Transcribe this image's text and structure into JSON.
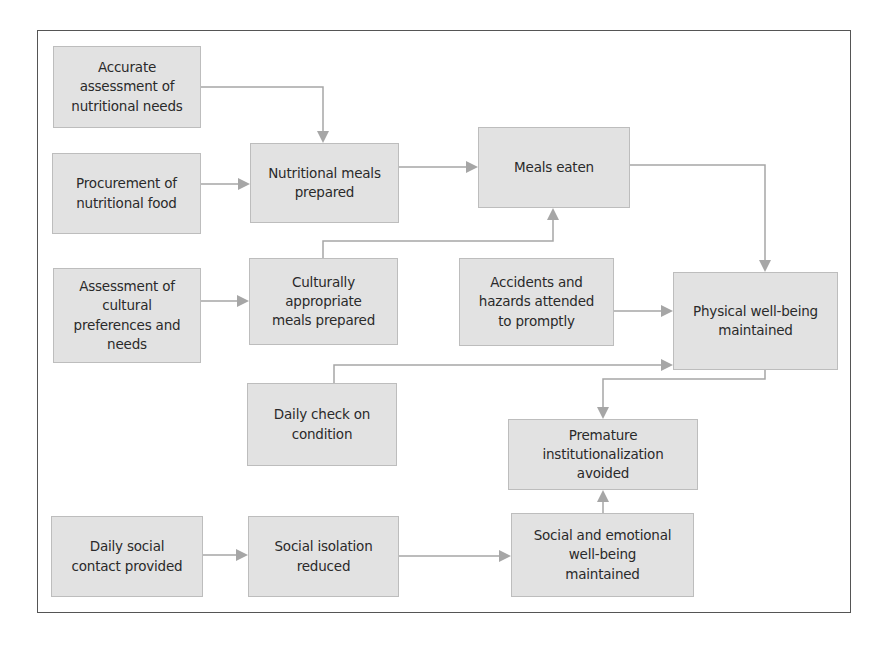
{
  "diagram": {
    "type": "flowchart",
    "colors": {
      "node_fill": "#e2e2e2",
      "node_border": "#bdbdbd",
      "connector": "#a6a6a6",
      "frame": "#555555",
      "text": "#2a2a2a"
    },
    "nodes": {
      "accurate_assessment": {
        "label": "Accurate\nassessment of\nnutritional needs"
      },
      "procurement": {
        "label": "Procurement of\nnutritional food"
      },
      "nutritional_meals": {
        "label": "Nutritional meals\nprepared"
      },
      "meals_eaten": {
        "label": "Meals eaten"
      },
      "assessment_cultural": {
        "label": "Assessment of\ncultural\npreferences and\nneeds"
      },
      "culturally_appropriate": {
        "label": "Culturally\nappropriate\nmeals prepared"
      },
      "accidents_hazards": {
        "label": "Accidents and\nhazards attended\nto promptly"
      },
      "physical_wellbeing": {
        "label": "Physical well-being\nmaintained"
      },
      "daily_check": {
        "label": "Daily check on\ncondition"
      },
      "premature_institutionalization": {
        "label": "Premature\ninstitutionalization\navoided"
      },
      "daily_social_contact": {
        "label": "Daily social\ncontact provided"
      },
      "social_isolation": {
        "label": "Social isolation\nreduced"
      },
      "social_emotional": {
        "label": "Social and emotional\nwell-being\nmaintained"
      }
    },
    "edges": [
      {
        "from": "accurate_assessment",
        "to": "nutritional_meals"
      },
      {
        "from": "procurement",
        "to": "nutritional_meals"
      },
      {
        "from": "nutritional_meals",
        "to": "meals_eaten"
      },
      {
        "from": "culturally_appropriate",
        "to": "meals_eaten"
      },
      {
        "from": "assessment_cultural",
        "to": "culturally_appropriate"
      },
      {
        "from": "meals_eaten",
        "to": "physical_wellbeing"
      },
      {
        "from": "accidents_hazards",
        "to": "physical_wellbeing"
      },
      {
        "from": "daily_check",
        "to": "physical_wellbeing"
      },
      {
        "from": "physical_wellbeing",
        "to": "premature_institutionalization"
      },
      {
        "from": "daily_social_contact",
        "to": "social_isolation"
      },
      {
        "from": "social_isolation",
        "to": "social_emotional"
      },
      {
        "from": "social_emotional",
        "to": "premature_institutionalization"
      }
    ]
  }
}
